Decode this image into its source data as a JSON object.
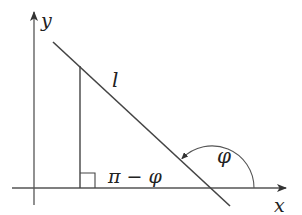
{
  "diagram": {
    "colors": {
      "background": "#ffffff",
      "stroke": "#4a4a4a",
      "text": "#222222"
    },
    "axes": {
      "x_label": "x",
      "y_label": "y",
      "origin": [
        34,
        188
      ],
      "x_axis": {
        "from": [
          12,
          188
        ],
        "to": [
          287,
          188
        ]
      },
      "y_axis": {
        "from": [
          34,
          205
        ],
        "to": [
          34,
          11
        ]
      }
    },
    "line_l": {
      "label": "l",
      "from": [
        53,
        42
      ],
      "to": [
        230,
        206
      ],
      "x_intercept": [
        212,
        188
      ]
    },
    "perpendicular": {
      "from": [
        80,
        65
      ],
      "to": [
        80,
        188
      ],
      "right_angle_marker": {
        "x": 80,
        "y": 173,
        "size": 15
      }
    },
    "angles": {
      "supplement": {
        "label": "π − φ",
        "position": [
          107,
          183
        ]
      },
      "inclination": {
        "label": "φ",
        "center": [
          212,
          188
        ],
        "radius": 42,
        "position": [
          217,
          160
        ],
        "arrow_end": [
          181,
          159
        ]
      }
    }
  }
}
